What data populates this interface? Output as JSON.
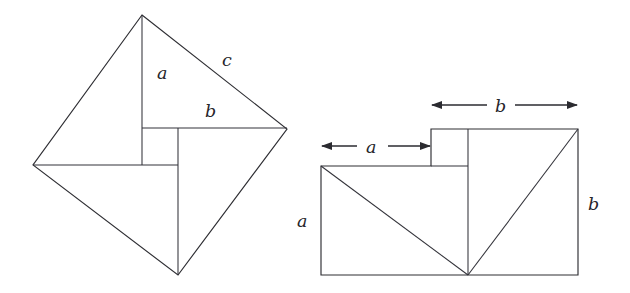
{
  "figure": {
    "kind": "geometric-diagram",
    "background_color": "#ffffff",
    "line_color": "#2e2e33",
    "label_color": "#26262b",
    "panels": [
      {
        "id": "left-panel",
        "name": "tilted-square-pinwheel",
        "description": "Square of side c tilted as a diamond, subdivided into four right triangles with legs a and b around a central square",
        "labels": [
          {
            "name": "label-a-left",
            "text": "a",
            "x": 157,
            "y": 79
          },
          {
            "name": "label-b-left",
            "text": "b",
            "x": 205,
            "y": 117
          },
          {
            "name": "label-c-left",
            "text": "c",
            "x": 222,
            "y": 66
          }
        ],
        "vertices": {
          "top": [
            142,
            15
          ],
          "right": [
            287,
            129
          ],
          "bottom": [
            178,
            275
          ],
          "left": [
            33,
            165
          ]
        },
        "inner_square": {
          "left": 142,
          "top": 128,
          "right": 178,
          "bottom": 165
        }
      },
      {
        "id": "right-panel",
        "name": "stepped-rectangle-rearrangement",
        "description": "Rearranged a-squared plus b-squared region: large rectangle with a notch step, split by a vertical line and two diagonals meeting at the bottom midpoint",
        "labels": [
          {
            "name": "label-a-side",
            "text": "a",
            "x": 297,
            "y": 227
          },
          {
            "name": "label-b-side",
            "text": "b",
            "x": 588,
            "y": 210
          },
          {
            "name": "label-a-dimension",
            "text": "a",
            "x": 370,
            "y": 153
          },
          {
            "name": "label-b-dimension",
            "text": "b",
            "x": 499,
            "y": 112
          }
        ],
        "outline": {
          "left": 321,
          "right": 578,
          "bottom": 275,
          "shoulder_top": 166,
          "step_top": 129,
          "step_left": 431,
          "divider_x": 468
        },
        "dimensions": [
          {
            "name": "dimension-a",
            "label": "a",
            "from_x": 321,
            "to_x": 431,
            "y": 146
          },
          {
            "name": "dimension-b",
            "label": "b",
            "from_x": 431,
            "to_x": 578,
            "y": 105
          }
        ]
      }
    ]
  }
}
